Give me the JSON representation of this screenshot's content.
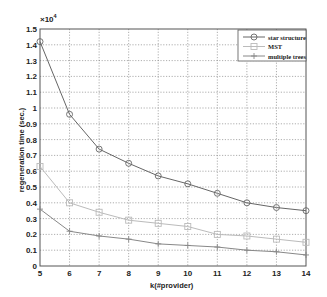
{
  "chart_data": {
    "type": "line",
    "title": "",
    "xlabel": "k(#provider)",
    "ylabel": "regeneration time (sec.)",
    "y_multiplier": "×10",
    "y_multiplier_exp": "4",
    "x": [
      5,
      6,
      7,
      8,
      9,
      10,
      11,
      12,
      13,
      14
    ],
    "xlim": [
      5,
      14
    ],
    "ylim": [
      0,
      1.5
    ],
    "x_ticks": [
      5,
      6,
      7,
      8,
      9,
      10,
      11,
      12,
      13,
      14
    ],
    "y_ticks": [
      0,
      0.1,
      0.2,
      0.3,
      0.4,
      0.5,
      0.6,
      0.7,
      0.8,
      0.9,
      1,
      1.1,
      1.2,
      1.3,
      1.4,
      1.5
    ],
    "y_tick_labels": [
      "0",
      "0.1",
      "0.2",
      "0.3",
      "0.4",
      "0.5",
      "0.6",
      "0.7",
      "0.8",
      "0.9",
      "1",
      "1.1",
      "1.2",
      "1.3",
      "1.4",
      "1.5"
    ],
    "grid": true,
    "legend_position": "upper right",
    "series": [
      {
        "name": "star structure",
        "marker": "circle",
        "color": "#666666",
        "values": [
          1.42,
          0.96,
          0.74,
          0.65,
          0.57,
          0.52,
          0.46,
          0.4,
          0.37,
          0.35
        ]
      },
      {
        "name": "MST",
        "marker": "square",
        "color": "#bbbbbb",
        "values": [
          0.63,
          0.4,
          0.34,
          0.29,
          0.27,
          0.25,
          0.2,
          0.19,
          0.17,
          0.15
        ]
      },
      {
        "name": "multiple trees",
        "marker": "plus",
        "color": "#888888",
        "values": [
          0.36,
          0.22,
          0.19,
          0.17,
          0.14,
          0.13,
          0.12,
          0.1,
          0.09,
          0.07
        ]
      }
    ]
  }
}
